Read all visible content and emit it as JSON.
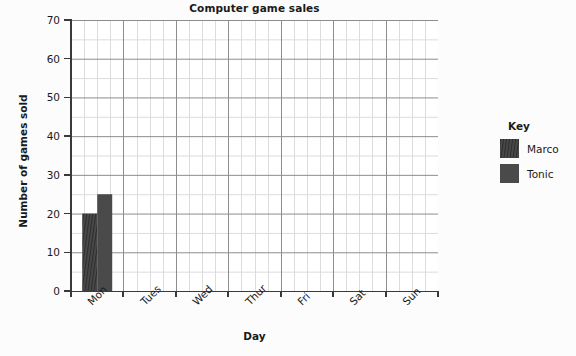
{
  "chart_data": {
    "type": "bar",
    "title": "Computer game sales",
    "xlabel": "Day",
    "ylabel": "Number of games sold",
    "categories": [
      "Mon",
      "Tues",
      "Wed",
      "Thur",
      "Fri",
      "Sat",
      "Sun"
    ],
    "series": [
      {
        "name": "Marco",
        "pattern": "hatched",
        "color": "#4a4a4a",
        "values": [
          20,
          null,
          null,
          null,
          null,
          null,
          null
        ]
      },
      {
        "name": "Tonic",
        "pattern": "solid",
        "color": "#4a4a4a",
        "values": [
          25,
          null,
          null,
          null,
          null,
          null,
          null
        ]
      }
    ],
    "ylim": [
      0,
      70
    ],
    "y_ticks": [
      0,
      10,
      20,
      30,
      40,
      50,
      60,
      70
    ],
    "y_tick_labels": [
      "0",
      "10",
      "20",
      "30",
      "40",
      "50",
      "60",
      "70"
    ],
    "y_minor_step": 5,
    "grid": true,
    "legend_position": "right",
    "legend_title": "Key"
  },
  "legend": {
    "title": "Key",
    "entries": [
      {
        "label": "Marco",
        "swatch": "hatched-swatch"
      },
      {
        "label": "Tonic",
        "swatch": "solid-swatch"
      }
    ]
  },
  "colors": {
    "bar": "#4a4a4a",
    "grid_major": "#8a8a8a",
    "grid_minor": "#d8d8d8",
    "axis": "#3a3a3a",
    "text": "#1a1a1a",
    "plot_background": "#ffffff",
    "page_background": "#fcfcfc"
  }
}
